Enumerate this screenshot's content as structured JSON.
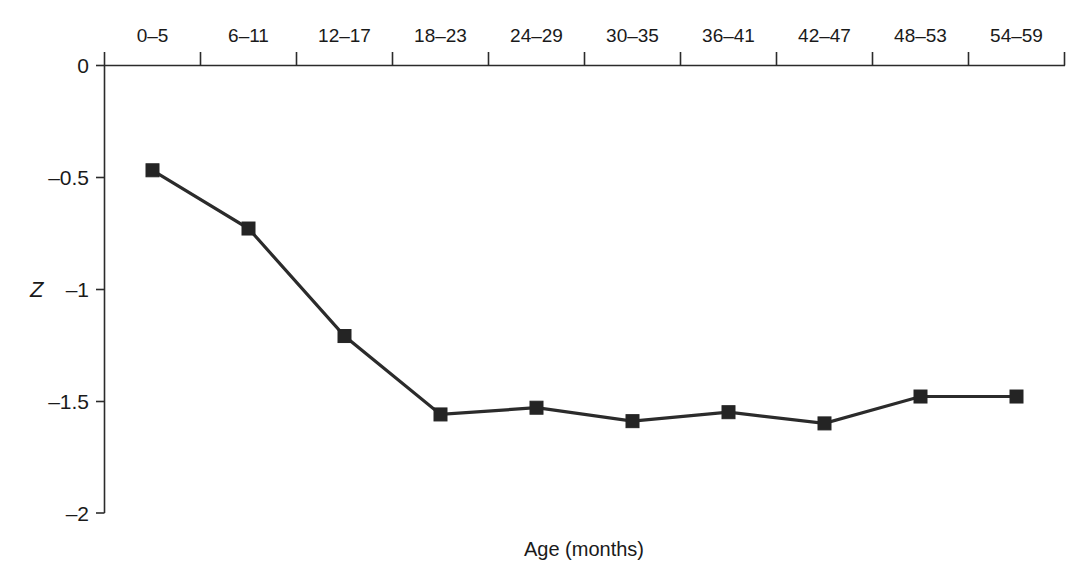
{
  "chart_data": {
    "type": "line",
    "title": "",
    "subtitle": "",
    "xlabel": "Age (months)",
    "ylabel": "Z",
    "categories": [
      "0–5",
      "6–11",
      "12–17",
      "18–23",
      "24–29",
      "30–35",
      "36–41",
      "42–47",
      "48–53",
      "54–59"
    ],
    "values": [
      -0.47,
      -0.73,
      -1.21,
      -1.56,
      -1.53,
      -1.59,
      -1.55,
      -1.6,
      -1.48,
      -1.48
    ],
    "series": [
      {
        "name": "Mean Z-score",
        "values": [
          -0.47,
          -0.73,
          -1.21,
          -1.56,
          -1.53,
          -1.59,
          -1.55,
          -1.6,
          -1.48,
          -1.48
        ]
      }
    ],
    "ylim": [
      -2,
      0
    ],
    "yticks": [
      0,
      -0.5,
      -1,
      -1.5,
      -2
    ],
    "ytick_labels": [
      "0",
      "–0.5",
      "–1",
      "–1.5",
      "–2"
    ],
    "x_axis_position": "top",
    "grid": false,
    "legend": "none",
    "marker": "square",
    "line_color": "#2b2b2b",
    "marker_color": "#242424"
  },
  "axes": {
    "x_label": "Age (months)",
    "y_label": "Z",
    "x_tick_labels": [
      "0–5",
      "6–11",
      "12–17",
      "18–23",
      "24–29",
      "30–35",
      "36–41",
      "42–47",
      "48–53",
      "54–59"
    ],
    "y_tick_labels": [
      "0",
      "–0.5",
      "–1",
      "–1.5",
      "–2"
    ]
  }
}
